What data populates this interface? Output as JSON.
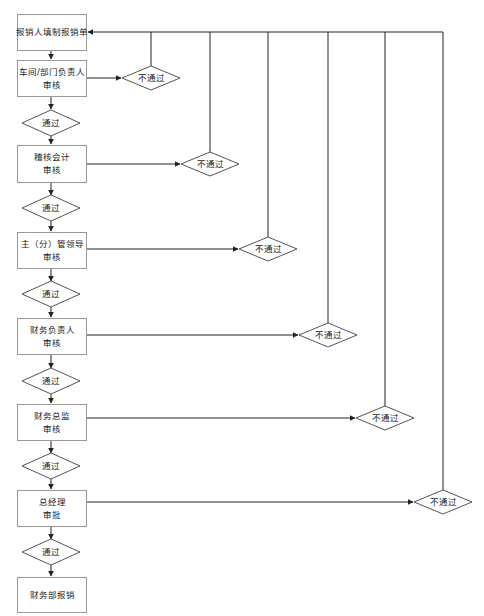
{
  "colors": {
    "line": "#222222",
    "box_border": "#9a9a9a",
    "text": "#1a1a1a",
    "background": "#ffffff"
  },
  "steps": [
    {
      "id": "submit",
      "line1": "报销人填制报销单",
      "line2": ""
    },
    {
      "id": "dept_head",
      "line1": "车间/部门负责人",
      "line2": "审核"
    },
    {
      "id": "audit_acct",
      "line1": "稽核会计",
      "line2": "审核"
    },
    {
      "id": "vp",
      "line1": "主（分）管领导",
      "line2": "审核"
    },
    {
      "id": "finance_head",
      "line1": "财务负责人",
      "line2": "审核"
    },
    {
      "id": "cfo",
      "line1": "财务总监",
      "line2": "审核"
    },
    {
      "id": "gm",
      "line1": "总经理",
      "line2": "审批"
    },
    {
      "id": "reimburse",
      "line1": "财务部报销",
      "line2": ""
    }
  ],
  "pass_label": "通过",
  "fail_label": "不通过",
  "pass_decisions": [
    {
      "label": "通过"
    },
    {
      "label": "通过"
    },
    {
      "label": "通过"
    },
    {
      "label": "通过"
    },
    {
      "label": "通过"
    },
    {
      "label": "通过"
    }
  ],
  "fail_decisions": [
    {
      "label": "不通过"
    },
    {
      "label": "不通过"
    },
    {
      "label": "不通过"
    },
    {
      "label": "不通过"
    },
    {
      "label": "不通过"
    },
    {
      "label": "不通过"
    }
  ]
}
